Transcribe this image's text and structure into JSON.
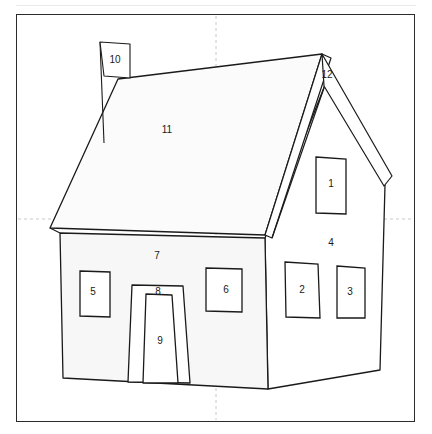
{
  "figure": {
    "background_color": "#ffffff",
    "frame_color": "#2b2b2b",
    "line_color": "#1a1a1a",
    "wall_fill_color": "#f7f7f7",
    "roof_fill_color": "#fbfbfb",
    "guide_color": "#c8c8c8"
  },
  "guides": {
    "horizontal_y": 219,
    "vertical_x": 216
  },
  "labels": [
    {
      "id": "1",
      "text": "1",
      "x": 331,
      "y": 184,
      "part": "right-upper-window"
    },
    {
      "id": "2",
      "text": "2",
      "x": 302,
      "y": 290,
      "part": "right-lower-window-left"
    },
    {
      "id": "3",
      "text": "3",
      "x": 350,
      "y": 292,
      "part": "right-lower-window-right"
    },
    {
      "id": "4",
      "text": "4",
      "x": 331,
      "y": 243,
      "part": "right-side-wall"
    },
    {
      "id": "5",
      "text": "5",
      "x": 93,
      "y": 292,
      "part": "front-left-window"
    },
    {
      "id": "6",
      "text": "6",
      "x": 226,
      "y": 290,
      "part": "front-right-window"
    },
    {
      "id": "7",
      "text": "7",
      "x": 157,
      "y": 256,
      "part": "front-wall"
    },
    {
      "id": "8",
      "text": "8",
      "x": 158,
      "y": 292,
      "part": "door-frame"
    },
    {
      "id": "9",
      "text": "9",
      "x": 160,
      "y": 341,
      "part": "door-panel"
    },
    {
      "id": "10",
      "text": "10",
      "x": 115,
      "y": 60,
      "part": "chimney"
    },
    {
      "id": "11",
      "text": "11",
      "x": 167,
      "y": 130,
      "part": "roof-plane"
    },
    {
      "id": "12",
      "text": "12",
      "x": 327,
      "y": 75,
      "part": "gable-peak"
    }
  ],
  "shapes": {
    "chimney": "M 100,42 L 130,44 L 130,78 L 104,76 L 100,42 Z",
    "chimney_back_edge": "M 100,42 L 104,143",
    "roof_plane": "M 118,79 L 322,54 L 265,235 L 50,228 Z",
    "roof_fascia": "M 265,235 L 322,54 L 332,59 L 272,238 Z",
    "gable_left": "M 325,85 L 265,235 L 272,238 L 329,92 Z",
    "gable_right": "M 325,85 L 390,178 L 384,186 L 322,94 Z",
    "right_eave_tip": "M 384,186 L 390,178",
    "right_gable_outer": "M 322,54 L 392,176 L 384,186",
    "front_wall": "M 60,233 L 265,238 L 268,389 L 63,378 Z",
    "right_wall": "M 265,238 L 325,85 L 385,185 L 380,370 L 268,389 Z",
    "left_eave_tip": "M 50,228 L 60,233",
    "window_1": "M 316,157 L 346,159 L 346,214 L 316,213 Z",
    "window_2": "M 285,262 L 318,264 L 320,318 L 286,317 Z",
    "window_3": "M 337,266 L 365,268 L 365,318 L 337,318 Z",
    "window_5": "M 80,271 L 110,272 L 110,317 L 80,316 Z",
    "window_6": "M 206,268 L 242,269 L 242,312 L 206,311 Z",
    "door_frame": "M 132,285 L 183,286 L 190,383 L 128,382 Z",
    "door_panel": "M 146,294 L 172,295 L 178,383 L 143,383 Z"
  }
}
